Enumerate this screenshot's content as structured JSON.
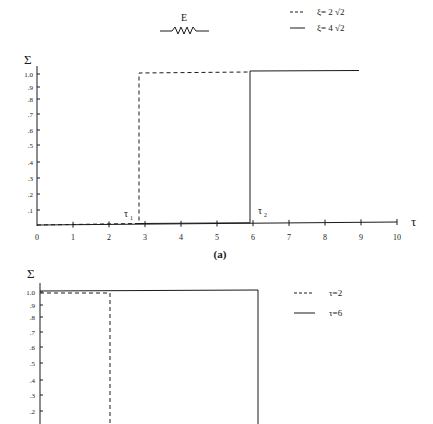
{
  "header": {
    "element_label": "E",
    "element_icon": "spring-resistor-icon"
  },
  "chart_data": [
    {
      "type": "line",
      "id": "a",
      "caption": "(a)",
      "title": "",
      "xlabel": "τ",
      "ylabel": "Σ",
      "xlim": [
        0,
        10
      ],
      "ylim": [
        0,
        1.0
      ],
      "xticks": [
        "0",
        "1",
        "2",
        "3",
        "4",
        "5",
        "6",
        "7",
        "8",
        "9",
        "10"
      ],
      "yticks": [
        ".1",
        ".2",
        ".3",
        ".4",
        ".5",
        ".6",
        ".7",
        ".8",
        ".9",
        "1.0"
      ],
      "grid": false,
      "legend_position": "top-right",
      "annotations": [
        {
          "text": "τ",
          "sub": "1",
          "x": 2.85
        },
        {
          "text": "τ",
          "sub": "2",
          "x": 5.9
        }
      ],
      "series": [
        {
          "name": "ξ= 2 √2",
          "style": "dashed",
          "x": [
            0,
            2.85,
            2.85,
            5.9
          ],
          "y": [
            0,
            0,
            0.995,
            0.995
          ]
        },
        {
          "name": "ξ= 4 √2",
          "style": "solid",
          "x": [
            0,
            5.9,
            5.9,
            8.9
          ],
          "y": [
            0,
            0,
            1.005,
            1.005
          ]
        }
      ]
    },
    {
      "type": "line",
      "id": "b",
      "caption": "",
      "title": "",
      "xlabel": "",
      "ylabel": "Σ",
      "ylim": [
        0,
        1.0
      ],
      "yticks": [
        ".2",
        ".3",
        ".4",
        ".5",
        ".6",
        ".7",
        ".8",
        ".9",
        "1.0"
      ],
      "grid": false,
      "legend_position": "top-right",
      "series": [
        {
          "name": "τ=2",
          "style": "dashed",
          "x": [
            0,
            1.95,
            1.95
          ],
          "y": [
            0.985,
            0.985,
            0.0
          ]
        },
        {
          "name": "τ=6",
          "style": "solid",
          "x": [
            0,
            6.0,
            6.0
          ],
          "y": [
            1.0,
            1.0,
            0.0
          ]
        }
      ]
    }
  ],
  "legend_top": [
    {
      "label": "ξ= 2 √2",
      "style": "dashed"
    },
    {
      "label": "ξ= 4 √2",
      "style": "solid"
    }
  ],
  "legend_bottom": [
    {
      "label": "τ=2",
      "style": "dashed"
    },
    {
      "label": "τ=6",
      "style": "solid"
    }
  ]
}
